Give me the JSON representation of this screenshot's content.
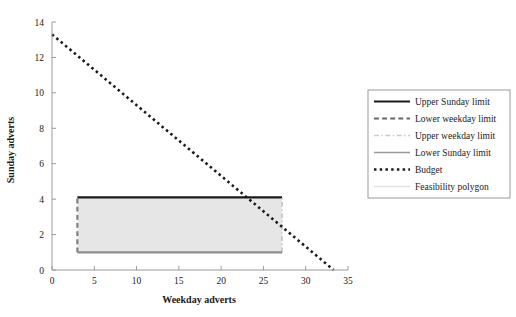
{
  "chart_data": {
    "type": "line",
    "title": "",
    "xlabel": "Weekday adverts",
    "ylabel": "Sunday adverts",
    "xlim": [
      0,
      35
    ],
    "ylim": [
      0,
      14
    ],
    "xticks": [
      0,
      5,
      10,
      15,
      20,
      25,
      30,
      35
    ],
    "yticks": [
      0,
      2,
      4,
      6,
      8,
      10,
      12,
      14
    ],
    "grid": false,
    "legend_position": "right",
    "series": [
      {
        "name": "Upper Sunday limit",
        "style": "solid",
        "color": "#1a1a1a",
        "width": 2.2,
        "orientation": "horizontal",
        "value": 4.1,
        "x_from": 3,
        "x_to": 27.2
      },
      {
        "name": "Lower weekday limit",
        "style": "dashed",
        "color": "#808080",
        "width": 2.2,
        "orientation": "vertical",
        "value": 3,
        "y_from": 1,
        "y_to": 4.1
      },
      {
        "name": "Upper weekday limit",
        "style": "dashdot",
        "color": "#c4c4c4",
        "width": 1.6,
        "orientation": "vertical",
        "value": 27.2,
        "y_from": 1,
        "y_to": 4.1
      },
      {
        "name": "Lower Sunday limit",
        "style": "solid",
        "color": "#8c8c8c",
        "width": 2.2,
        "orientation": "horizontal",
        "value": 1,
        "x_from": 3,
        "x_to": 27.2
      },
      {
        "name": "Budget",
        "style": "dotted",
        "color": "#1a1a1a",
        "width": 2.6,
        "points": [
          [
            0,
            13.3
          ],
          [
            33.3,
            0
          ]
        ]
      }
    ],
    "shapes": [
      {
        "name": "Feasibility polygon",
        "type": "polygon",
        "fill": "#e6e6e6",
        "vertices": [
          [
            3,
            1
          ],
          [
            27.2,
            1
          ],
          [
            27.2,
            4.1
          ],
          [
            3,
            4.1
          ]
        ]
      }
    ],
    "legend_entries": [
      {
        "label": "Upper Sunday limit",
        "style": "solid",
        "color": "#1a1a1a",
        "width": 2.2
      },
      {
        "label": "Lower weekday limit",
        "style": "dashed",
        "color": "#666666",
        "width": 2.2
      },
      {
        "label": "Upper weekday limit",
        "style": "dashdot",
        "color": "#c9c9c9",
        "width": 1.6
      },
      {
        "label": "Lower Sunday limit",
        "style": "solid",
        "color": "#9a9a9a",
        "width": 1.6
      },
      {
        "label": "Budget",
        "style": "dotted",
        "color": "#1a1a1a",
        "width": 2.6
      },
      {
        "label": "Feasibility polygon",
        "style": "solid",
        "color": "#e2e2e2",
        "width": 1.6
      }
    ]
  },
  "axes": {
    "x_title": "Weekday adverts",
    "y_title": "Sunday adverts",
    "x_tick_labels": [
      "0",
      "5",
      "10",
      "15",
      "20",
      "25",
      "30",
      "35"
    ],
    "y_tick_labels": [
      "0",
      "2",
      "4",
      "6",
      "8",
      "10",
      "12",
      "14"
    ]
  },
  "legend": {
    "items": [
      "Upper Sunday limit",
      "Lower weekday limit",
      "Upper weekday limit",
      "Lower Sunday limit",
      "Budget",
      "Feasibility polygon"
    ]
  },
  "colors": {
    "axis": "#9a9a9a",
    "text": "#1a1a1a",
    "polygon_fill": "#e6e6e6",
    "legend_border": "#9a9a9a",
    "background": "#ffffff"
  }
}
